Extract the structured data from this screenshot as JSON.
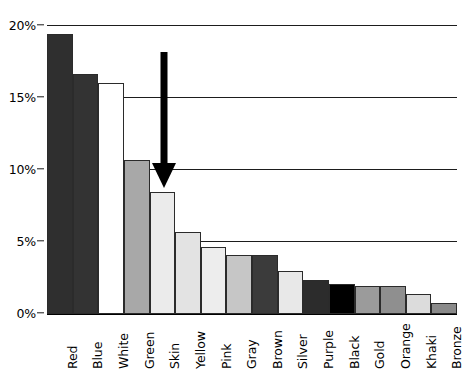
{
  "chart_data": {
    "type": "bar",
    "title": "",
    "subtitle": "",
    "xlabel": "",
    "ylabel": "",
    "categories": [
      "Red",
      "Blue",
      "White",
      "Green",
      "Skin",
      "Yellow",
      "Pink",
      "Gray",
      "Brown",
      "Silver",
      "Purple",
      "Black",
      "Gold",
      "Orange",
      "Khaki",
      "Bronze"
    ],
    "values": [
      19.4,
      16.6,
      16.0,
      10.6,
      8.4,
      5.6,
      4.6,
      4.0,
      4.0,
      2.9,
      2.3,
      2.0,
      1.9,
      1.9,
      1.3,
      0.7
    ],
    "bar_fills": [
      "#2f2f2f",
      "#333333",
      "#ffffff",
      "#a8a8a8",
      "#ebebeb",
      "#e3e3e3",
      "#ededed",
      "#c6c6c6",
      "#3b3b3b",
      "#e8e8e8",
      "#2c2c2c",
      "#000000",
      "#9b9b9b",
      "#8f8f8f",
      "#dcdcdc",
      "#8a8a8a"
    ],
    "ylim": [
      0,
      20
    ],
    "yticks": [
      0,
      5,
      10,
      15,
      20
    ],
    "ytick_labels": [
      "0%",
      "5%",
      "10%",
      "15%",
      "20%"
    ],
    "grid": "horizontal",
    "legend": "none",
    "annotations": [
      {
        "name": "down-arrow",
        "kind": "arrow",
        "direction": "down",
        "points_at_category": "Skin",
        "color": "#000000"
      }
    ]
  }
}
